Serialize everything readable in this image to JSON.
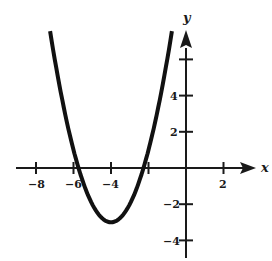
{
  "chart_data": {
    "type": "line",
    "title": "",
    "xlabel": "x",
    "ylabel": "y",
    "function_description": "parabola y = (x + 4)^2 - 3",
    "vertex": [
      -4,
      -3
    ],
    "x_intercepts": [
      -5.73,
      -2.27
    ],
    "xlim": [
      -8.9,
      4
    ],
    "ylim": [
      -5,
      8.5
    ],
    "x_ticks": [
      -8,
      -6,
      -4,
      -2,
      2
    ],
    "x_tick_labels": [
      "-8",
      "-6",
      "-4",
      "",
      "2"
    ],
    "y_ticks": [
      -4,
      -2,
      2,
      4,
      6
    ],
    "y_tick_labels": [
      "-4",
      "-2",
      "2",
      "4",
      ""
    ],
    "grid": false,
    "legend": null,
    "series": [
      {
        "name": "parabola",
        "x": [
          -7.25,
          -7,
          -6.5,
          -6,
          -5.5,
          -5,
          -4.5,
          -4,
          -3.5,
          -3,
          -2.5,
          -2,
          -1.5,
          -1,
          -0.75
        ],
        "y": [
          7.56,
          6,
          3.25,
          1,
          -0.75,
          -2,
          -2.75,
          -3,
          -2.75,
          -2,
          -0.75,
          1,
          3.25,
          6,
          7.56
        ]
      }
    ]
  },
  "axes": {
    "x_label": "x",
    "y_label": "y",
    "x_tick_labels": [
      "−8",
      "−6",
      "−4",
      "2"
    ],
    "y_tick_labels": [
      "4",
      "2",
      "−2",
      "−4"
    ]
  }
}
